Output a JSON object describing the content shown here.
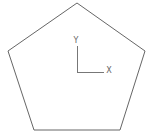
{
  "diagram": {
    "shape": "pentagon",
    "stroke_color": "#666666",
    "axes": {
      "x_label": "X",
      "y_label": "Y",
      "color": "#777777"
    }
  }
}
